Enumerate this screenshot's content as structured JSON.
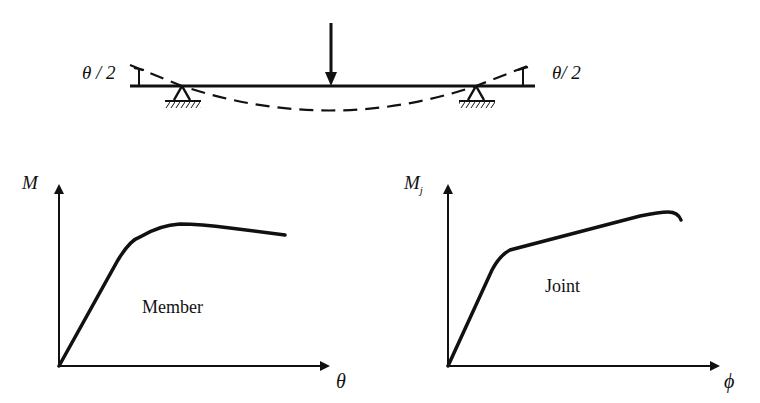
{
  "beam": {
    "left_angle_label": "θ / 2",
    "right_angle_label": "θ/ 2",
    "load": "point-load-arrow",
    "supports": [
      "pin-support-left",
      "pin-support-right"
    ],
    "deflected_shape": "dashed-curve"
  },
  "member_chart": {
    "y_axis_label": "M",
    "x_axis_label": "θ",
    "curve_label": "Member"
  },
  "joint_chart": {
    "y_axis_label": "M",
    "y_axis_subscript": "j",
    "x_axis_label": "ϕ",
    "curve_label": "Joint"
  },
  "colors": {
    "ink": "#111111",
    "background": "#ffffff"
  }
}
